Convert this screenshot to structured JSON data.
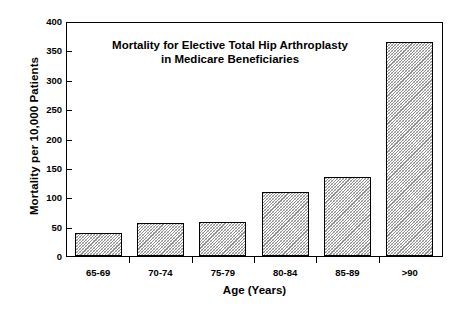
{
  "chart_data": {
    "type": "bar",
    "title": "Mortality for Elective  Total Hip Arthroplasty\nin Medicare Beneficiaries",
    "title_line1": "Mortality for Elective  Total Hip Arthroplasty",
    "title_line2": "in Medicare Beneficiaries",
    "xlabel": "Age (Years)",
    "ylabel": "Mortality per 10,000 Patients",
    "categories": [
      "65-69",
      "70-74",
      "75-79",
      "80-84",
      "85-89",
      ">90"
    ],
    "values": [
      40,
      56,
      59,
      110,
      135,
      367
    ],
    "ylim": [
      0,
      400
    ],
    "yticks": [
      0,
      50,
      100,
      150,
      200,
      250,
      300,
      350,
      400
    ],
    "ytick_labels": [
      "0",
      "50",
      "100",
      "150",
      "200",
      "250",
      "300",
      "350",
      "400"
    ],
    "grid": false,
    "legend": null,
    "bar_fill": "#b0b0b0",
    "bar_edge": "#000000",
    "axis_color": "#000000",
    "background": "#ffffff"
  }
}
